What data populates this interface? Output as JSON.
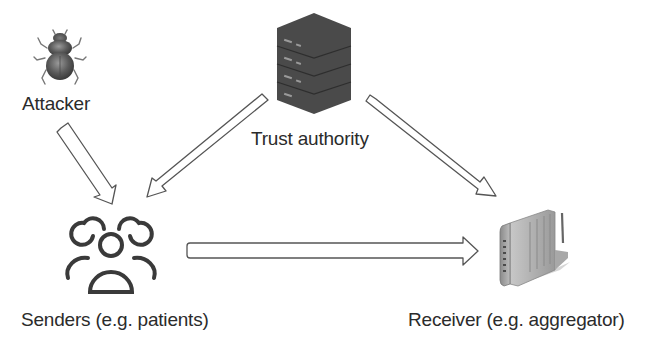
{
  "diagram": {
    "nodes": [
      {
        "id": "attacker",
        "label": "Attacker",
        "icon": "beetle-icon"
      },
      {
        "id": "trust_authority",
        "label": "Trust authority",
        "icon": "server-stack-icon"
      },
      {
        "id": "senders",
        "label": "Senders (e.g. patients)",
        "icon": "user-group-icon"
      },
      {
        "id": "receiver",
        "label": "Receiver (e.g. aggregator)",
        "icon": "router-icon"
      }
    ],
    "edges": [
      {
        "from": "attacker",
        "to": "senders",
        "style": "hollow-block-arrow"
      },
      {
        "from": "trust_authority",
        "to": "senders",
        "style": "hollow-block-arrow"
      },
      {
        "from": "trust_authority",
        "to": "receiver",
        "style": "hollow-block-arrow"
      },
      {
        "from": "senders",
        "to": "receiver",
        "style": "hollow-block-arrow"
      }
    ],
    "colors": {
      "background": "#ffffff",
      "arrow_stroke": "#555555",
      "icon_dark": "#3a3a3a",
      "text": "#2b2b2b"
    }
  }
}
